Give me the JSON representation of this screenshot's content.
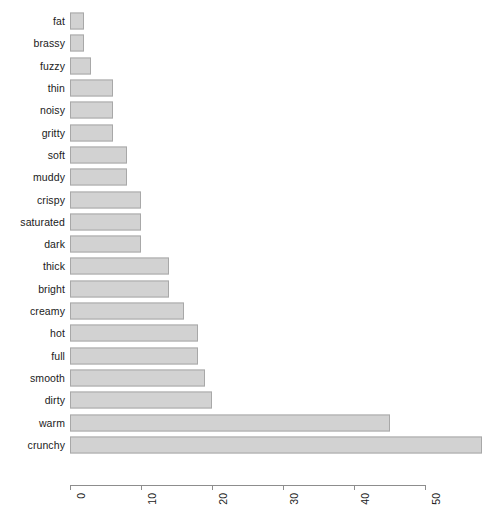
{
  "chart_data": {
    "type": "bar",
    "orientation": "horizontal",
    "title": "",
    "subtitle": "",
    "xlabel": "",
    "ylabel": "",
    "grid": false,
    "legend": null,
    "xlim": [
      0,
      58
    ],
    "xticks": [
      "0",
      "10",
      "20",
      "30",
      "40",
      "50"
    ],
    "xtick_values": [
      0,
      10,
      20,
      30,
      40,
      50
    ],
    "xtick_rotation": 90,
    "categories": [
      "fat",
      "brassy",
      "fuzzy",
      "thin",
      "noisy",
      "gritty",
      "soft",
      "muddy",
      "crispy",
      "saturated",
      "dark",
      "thick",
      "bright",
      "creamy",
      "hot",
      "full",
      "smooth",
      "dirty",
      "warm",
      "crunchy"
    ],
    "values": [
      2,
      2,
      3,
      6,
      6,
      6,
      8,
      8,
      10,
      10,
      10,
      14,
      14,
      16,
      18,
      18,
      19,
      20,
      45,
      58
    ],
    "bar_fill": "#d2d2d2",
    "bar_border": "#a8a8a8",
    "axis_color": "#8d8d8d",
    "text_color": "#1a1a1a"
  }
}
